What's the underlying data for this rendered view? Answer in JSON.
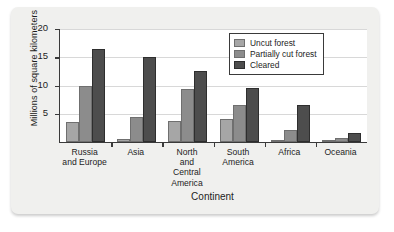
{
  "chart_data": {
    "type": "bar",
    "title": "",
    "xlabel": "Continent",
    "ylabel": "Millions of square kilometers",
    "ylim": [
      0,
      20
    ],
    "yticks": [
      5,
      10,
      15,
      20
    ],
    "grid": true,
    "legend_position": "top-right",
    "categories": [
      "Russia\nand Europe",
      "Asia",
      "North\nand\nCentral\nAmerica",
      "South\nAmerica",
      "Africa",
      "Oceania"
    ],
    "series": [
      {
        "name": "Uncut forest",
        "color": "#a6a6a6",
        "values": [
          3.5,
          0.6,
          3.8,
          4.1,
          0.4,
          0.1
        ]
      },
      {
        "name": "Partially cut forest",
        "color": "#8c8c8c",
        "values": [
          10.0,
          4.5,
          9.4,
          6.5,
          2.1,
          0.7
        ]
      },
      {
        "name": "Cleared",
        "color": "#4d4d4d",
        "values": [
          16.5,
          15.0,
          12.5,
          9.5,
          6.6,
          1.6
        ]
      }
    ]
  }
}
